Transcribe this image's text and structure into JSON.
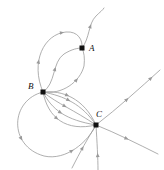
{
  "figure": {
    "type": "phase-portrait",
    "background_color": "#ffffff",
    "curve_color": "#9a9a9a",
    "node_color": "#111111",
    "label_color": "#111111",
    "stroke_width": 0.8,
    "node_size": 5,
    "width": 164,
    "height": 170
  },
  "nodes": [
    {
      "id": "A",
      "label": "A",
      "x": 82,
      "y": 48,
      "label_x": 89,
      "label_y": 44
    },
    {
      "id": "B",
      "label": "B",
      "x": 43,
      "y": 92,
      "label_x": 28,
      "label_y": 82
    },
    {
      "id": "C",
      "label": "C",
      "x": 96,
      "y": 125,
      "label_x": 96,
      "label_y": 110
    }
  ],
  "chart_data": {
    "type": "line",
    "title": "",
    "xlabel": "",
    "ylabel": "",
    "grid": false,
    "legend": "none",
    "node_labels": [
      "A",
      "B",
      "C"
    ],
    "node_points": [
      [
        82,
        48
      ],
      [
        43,
        92
      ],
      [
        96,
        125
      ]
    ],
    "edge_count": 14,
    "arrow_count": 18
  },
  "edges": [
    {
      "name": "B-to-A-upper-loop",
      "from": "B",
      "to": "A",
      "path": "M43,92 C30,62 44,34 66,32 C78,31 83,40 82,48",
      "arrows": [
        0.33,
        0.72
      ]
    },
    {
      "name": "B-to-A-inner-s-curve",
      "from": "B",
      "to": "A",
      "path": "M43,92 C56,84 52,62 64,54 C72,49 78,48 82,48",
      "arrows": [
        0.45
      ]
    },
    {
      "name": "B-to-A-outer-right-curve",
      "from": "B",
      "to": "A",
      "path": "M43,92 C62,95 80,82 84,66 C85,58 84,52 82,48",
      "arrows": [
        0.55
      ]
    },
    {
      "name": "A-outgoing-top-s-curve",
      "from": "A",
      "to": "boundary-top",
      "path": "M82,48 C90,38 88,24 96,16 C100,12 103,10 104,8",
      "arrows": [
        0.55
      ]
    },
    {
      "name": "B-to-C-arc-1",
      "from": "B",
      "to": "C",
      "path": "M43,92 C62,90 84,98 96,125",
      "arrows": [
        0.4
      ]
    },
    {
      "name": "B-to-C-arc-2",
      "from": "B",
      "to": "C",
      "path": "M43,92 C64,96 82,104 96,125",
      "arrows": [
        0.45
      ]
    },
    {
      "name": "B-to-C-arc-3",
      "from": "B",
      "to": "C",
      "path": "M43,92 C58,104 74,110 96,125",
      "arrows": [
        0.45
      ]
    },
    {
      "name": "B-to-C-arc-4",
      "from": "B",
      "to": "C",
      "path": "M43,92 C52,110 66,120 96,125",
      "arrows": [
        0.45
      ]
    },
    {
      "name": "B-to-C-lower-arc",
      "from": "B",
      "to": "C",
      "path": "M43,92 C48,118 66,132 96,125",
      "arrows": [
        0.45
      ]
    },
    {
      "name": "B-to-C-big-outer-loop",
      "from": "B",
      "to": "C",
      "path": "M43,92 C10,100 8,146 44,156 C66,161 88,142 96,125",
      "arrows": [
        0.4,
        0.78
      ]
    },
    {
      "name": "C-outgoing-upper-right-ray",
      "from": "C",
      "to": "boundary-right-top",
      "path": "M96,125 C118,108 140,88 160,70",
      "arrows": [
        0.5,
        0.88
      ]
    },
    {
      "name": "C-outgoing-lower-right-ray",
      "from": "C",
      "to": "boundary-right-bottom",
      "path": "M96,125 C116,133 138,144 158,154",
      "arrows": [
        0.52
      ]
    },
    {
      "name": "C-incoming-vertical-ray",
      "from": "boundary-bottom",
      "to": "C",
      "path": "M98,170 C98,158 97,142 96,125",
      "arrows": [
        0.38
      ]
    },
    {
      "name": "C-incoming-lower-left-curve",
      "from": "boundary-bottom-left",
      "to": "C",
      "path": "M72,168 C80,152 88,138 96,125",
      "arrows": [
        0.5
      ]
    }
  ]
}
